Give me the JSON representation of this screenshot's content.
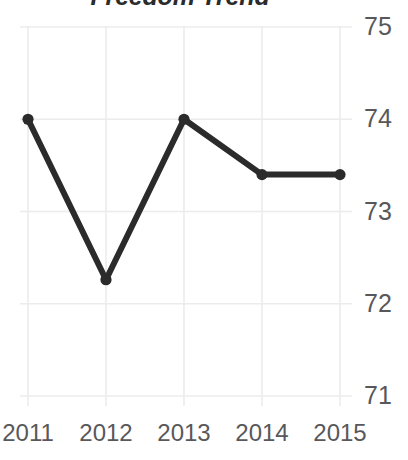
{
  "chart_data": {
    "type": "line",
    "title": "Freedom Trend",
    "xlabel": "",
    "ylabel": "",
    "categories": [
      "2011",
      "2012",
      "2013",
      "2014",
      "2015"
    ],
    "x": [
      2011,
      2012,
      2013,
      2014,
      2015
    ],
    "values": [
      74.0,
      72.26,
      74.0,
      73.4,
      73.4
    ],
    "series": [
      {
        "name": "Freedom Trend",
        "values": [
          74.0,
          72.26,
          74.0,
          73.4,
          73.4
        ]
      }
    ],
    "ylim": [
      71,
      75
    ],
    "yticks": [
      75,
      74,
      73,
      72,
      71
    ],
    "ytick_labels": [
      "75",
      "74",
      "73",
      "72",
      "71"
    ],
    "xticks": [
      2011,
      2012,
      2013,
      2014,
      2015
    ],
    "xtick_labels": [
      "2011",
      "2012",
      "2013",
      "2014",
      "2015"
    ],
    "grid": true,
    "grid_color": "#ececec",
    "legend": "none",
    "line_color": "#2b2b2b",
    "marker": "circle",
    "marker_color": "#2b2b2b",
    "axis_label_color": "#58585a",
    "background": "#ffffff"
  }
}
